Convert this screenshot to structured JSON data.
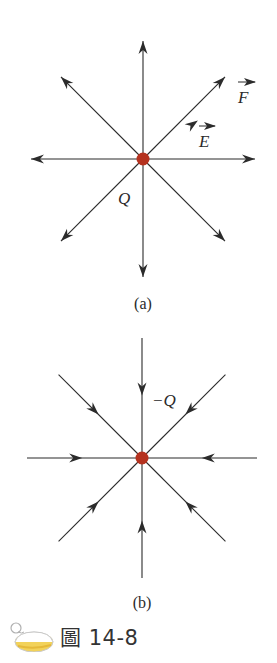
{
  "figure": {
    "panel_a": {
      "charge_label": "Q",
      "field_label": "E",
      "force_label": "F",
      "subcaption": "(a)",
      "field_direction": "outward",
      "line_count": 8
    },
    "panel_b": {
      "charge_label": "−Q",
      "subcaption": "(b)",
      "field_direction": "inward",
      "line_count": 8
    },
    "caption": {
      "icon": "flask-icon",
      "text": "圖 14-8"
    },
    "colors": {
      "charge": "#b5321f",
      "line": "#2b2b2b",
      "text": "#2a2a2a"
    }
  }
}
